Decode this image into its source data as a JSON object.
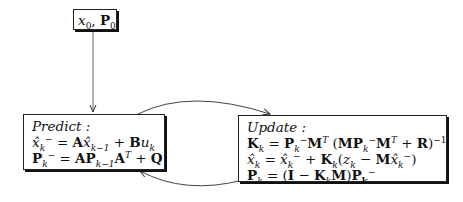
{
  "diagram": {
    "type": "flowchart",
    "nodes": [
      {
        "id": "init",
        "label": "x_0, P_0",
        "parts": {
          "x": "x",
          "x_sub": "0",
          "sep": ", ",
          "P": "P",
          "P_sub": "0"
        }
      },
      {
        "id": "predict",
        "heading": "Predict :",
        "equations": [
          "x̂_k^- = A x̂_{k-1} + B u_k",
          "P_k^- = A P_{k-1} A^T + Q"
        ]
      },
      {
        "id": "update",
        "heading": "Update :",
        "equations": [
          "K_k = P_k^- M^T (M P_k^- M^T + R)^{-1}",
          "x̂_k = x̂_k^- + K_k (z_k - M x̂_k^-)",
          "P_k = (I - K_k M) P_k^-"
        ]
      }
    ],
    "edges": [
      {
        "from": "init",
        "to": "predict",
        "style": "straight-arrow"
      },
      {
        "from": "predict",
        "to": "update",
        "style": "curved-arrow-top"
      },
      {
        "from": "update",
        "to": "predict",
        "style": "curved-arrow-bottom"
      }
    ]
  }
}
